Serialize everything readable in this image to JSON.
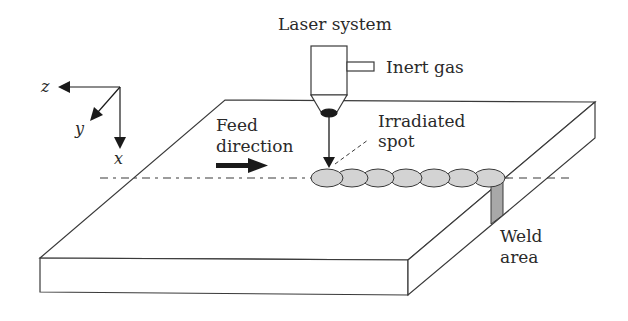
{
  "diagram": {
    "type": "laser welding schematic",
    "labels": {
      "laser_system": "Laser system",
      "inert_gas": "Inert gas",
      "irradiated_spot_line1": "Irradiated",
      "irradiated_spot_line2": "spot",
      "feed_line1": "Feed",
      "feed_line2": "direction",
      "weld_line1": "Weld",
      "weld_line2": "area"
    },
    "axes": {
      "z": "z",
      "y": "y",
      "x": "x"
    },
    "bead_count": 7,
    "colors": {
      "stroke": "#3a3a3a",
      "bead_fill": "#d3d3d3",
      "weld_fill": "#a8a8a8",
      "spot_fill": "#1a1a1a",
      "background": "#ffffff"
    }
  }
}
